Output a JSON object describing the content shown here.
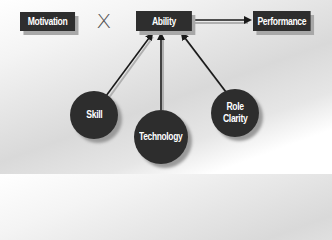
{
  "diagram": {
    "nodes": {
      "motivation": {
        "label": "Motivation",
        "shape": "rectangle"
      },
      "ability": {
        "label": "Ability",
        "shape": "rectangle"
      },
      "performance": {
        "label": "Performance",
        "shape": "rectangle"
      },
      "skill": {
        "label": "Skill",
        "shape": "circle"
      },
      "technology": {
        "label": "Technology",
        "shape": "circle"
      },
      "role_clarity": {
        "label_line1": "Role",
        "label_line2": "Clarity",
        "shape": "circle"
      }
    },
    "operator": {
      "symbol": "X",
      "meaning": "multiply"
    },
    "edges": [
      {
        "from": "ability",
        "to": "performance"
      },
      {
        "from": "skill",
        "to": "ability"
      },
      {
        "from": "technology",
        "to": "ability"
      },
      {
        "from": "role_clarity",
        "to": "ability"
      }
    ],
    "colors": {
      "node_fill": "#2e2e2e",
      "node_text": "#ffffff",
      "shadow": "#a8a8a8",
      "arrow": "#1a1a1a",
      "background": "#e0e0e0"
    }
  }
}
